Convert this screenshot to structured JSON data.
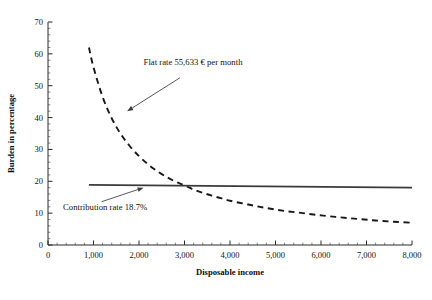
{
  "chart_data": {
    "type": "line",
    "title": "",
    "xlabel": "Disposable income",
    "ylabel": "Burden in percentage",
    "xlim": [
      0,
      8000
    ],
    "ylim": [
      0,
      70
    ],
    "grid": false,
    "legend_position": "none",
    "x_ticks": [
      0,
      1000,
      2000,
      3000,
      4000,
      5000,
      6000,
      7000,
      8000
    ],
    "x_tick_labels": [
      "0",
      "1,000",
      "2,000",
      "3,000",
      "4,000",
      "5,000",
      "6,000",
      "7,000",
      "8,000"
    ],
    "x_minor_step": 200,
    "y_ticks": [
      0,
      10,
      20,
      30,
      40,
      50,
      60,
      70
    ],
    "y_tick_labels": [
      "0",
      "10",
      "20",
      "30",
      "40",
      "50",
      "60",
      "70"
    ],
    "y_minor_step": 2,
    "series": [
      {
        "name": "Flat rate 55,633 € per month",
        "style": "dashed",
        "color": "#181818",
        "x": [
          900,
          1000,
          1200,
          1400,
          1600,
          1800,
          2000,
          2200,
          2400,
          2600,
          2800,
          3000,
          3200,
          3400,
          3600,
          3800,
          4000,
          4400,
          4800,
          5200,
          5600,
          6000,
          6400,
          6800,
          7200,
          7600,
          8000
        ],
        "values": [
          62.0,
          55.8,
          46.5,
          39.8,
          34.8,
          31.0,
          27.9,
          25.3,
          23.2,
          21.4,
          19.9,
          18.7,
          17.4,
          16.4,
          15.5,
          14.7,
          13.9,
          12.7,
          11.6,
          10.7,
          10.0,
          9.3,
          8.7,
          8.2,
          7.7,
          7.3,
          7.0
        ]
      },
      {
        "name": "Contribution rate 18.7%",
        "style": "solid",
        "color": "#3b3b3b",
        "x": [
          900,
          8000
        ],
        "values": [
          18.9,
          18.0
        ]
      }
    ],
    "annotations": [
      {
        "id": "flat-rate-annotation",
        "text": "Flat rate 55,633 € per month",
        "text_x": 2100,
        "text_y": 56.5,
        "arrow_from_x": 2900,
        "arrow_from_y": 52.5,
        "arrow_to_x": 1740,
        "arrow_to_y": 42.0
      },
      {
        "id": "contribution-rate-annotation",
        "text": "Contribution rate 18.7%",
        "text_x": 330,
        "text_y": 11.0,
        "arrow_from_x": 1180,
        "arrow_from_y": 13.6,
        "arrow_to_x": 2100,
        "arrow_to_y": 18.0
      }
    ]
  }
}
